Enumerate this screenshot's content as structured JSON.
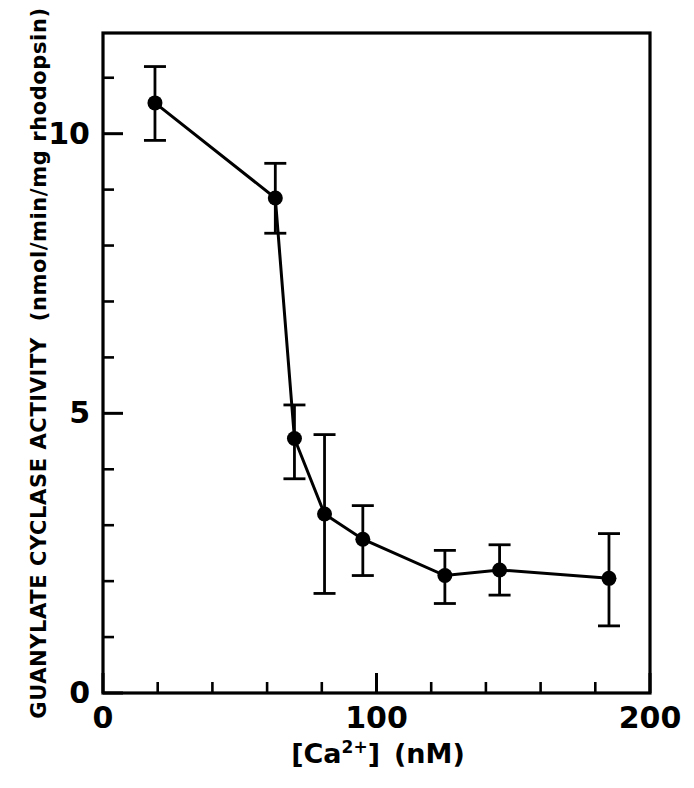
{
  "chart_data": {
    "type": "line",
    "title": "",
    "subtitle": "",
    "xlabel": "[Ca2+]  (nM)",
    "xlabel_parts": {
      "bracket_open": "[",
      "species": "Ca",
      "superscript": "2+",
      "bracket_close": "]",
      "unit": "(nM)"
    },
    "ylabel": "GUANYLATE CYCLASE ACTIVITY  (nmol/min/mg  rhodopsin)",
    "ylabel_parts": {
      "main": "GUANYLATE  CYCLASE  ACTIVITY",
      "units": "(nmol/min/mg  rhodopsin)"
    },
    "xlim": [
      0,
      200
    ],
    "ylim": [
      0,
      11.8
    ],
    "x_major_ticks": [
      0,
      100,
      200
    ],
    "x_major_tick_labels": [
      "0",
      "100",
      "200"
    ],
    "x_minor_tick_step": 20,
    "y_major_ticks": [
      0,
      5,
      10
    ],
    "y_major_tick_labels": [
      "0",
      "5",
      "10"
    ],
    "y_minor_tick_step": 1,
    "grid": false,
    "legend": null,
    "legend_position": "none",
    "marker": "filled-circle",
    "line_color": "#000000",
    "marker_color": "#000000",
    "errorbar_style": "vertical-capped",
    "x": [
      19,
      63,
      70,
      81,
      95,
      125,
      145,
      185
    ],
    "values": [
      10.55,
      8.85,
      4.55,
      3.2,
      2.75,
      2.1,
      2.2,
      2.05
    ],
    "y_err_low": [
      0.67,
      0.63,
      0.72,
      1.42,
      0.65,
      0.5,
      0.45,
      0.85
    ],
    "y_err_high": [
      0.65,
      0.62,
      0.6,
      1.42,
      0.6,
      0.45,
      0.45,
      0.8
    ],
    "series": [
      {
        "name": "guanylate cyclase activity",
        "points": [
          {
            "x": 19,
            "y": 10.55,
            "err_low": 0.67,
            "err_high": 0.65
          },
          {
            "x": 63,
            "y": 8.85,
            "err_low": 0.63,
            "err_high": 0.62
          },
          {
            "x": 70,
            "y": 4.55,
            "err_low": 0.72,
            "err_high": 0.6
          },
          {
            "x": 81,
            "y": 3.2,
            "err_low": 1.42,
            "err_high": 1.42
          },
          {
            "x": 95,
            "y": 2.75,
            "err_low": 0.65,
            "err_high": 0.6
          },
          {
            "x": 125,
            "y": 2.1,
            "err_low": 0.5,
            "err_high": 0.45
          },
          {
            "x": 145,
            "y": 2.2,
            "err_low": 0.45,
            "err_high": 0.45
          },
          {
            "x": 185,
            "y": 2.05,
            "err_low": 0.85,
            "err_high": 0.8
          }
        ]
      }
    ]
  }
}
